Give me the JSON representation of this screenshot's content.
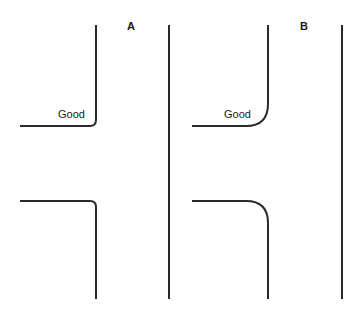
{
  "diagram": {
    "panels": [
      {
        "label": "A",
        "corner_style": "small radius",
        "top_curb": {
          "annotation": "Good"
        },
        "bottom_curb": {
          "annotation": ""
        }
      },
      {
        "label": "B",
        "corner_style": "large radius",
        "top_curb": {
          "annotation": "Good"
        },
        "bottom_curb": {
          "annotation": ""
        }
      }
    ],
    "line_color": "#2a2a2a",
    "background": "#ffffff"
  }
}
